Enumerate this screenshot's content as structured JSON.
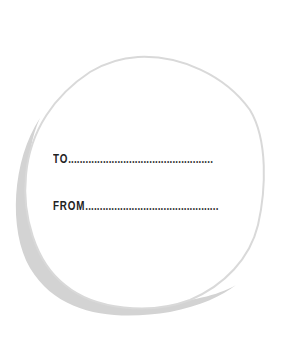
{
  "tag": {
    "to_label": "TO",
    "from_label": "FROM",
    "to_dots": "..................................................",
    "from_dots": "..............................................",
    "colors": {
      "outline": "#d9d9d9",
      "shadow": "#d3d3d3",
      "text": "#222222"
    }
  }
}
